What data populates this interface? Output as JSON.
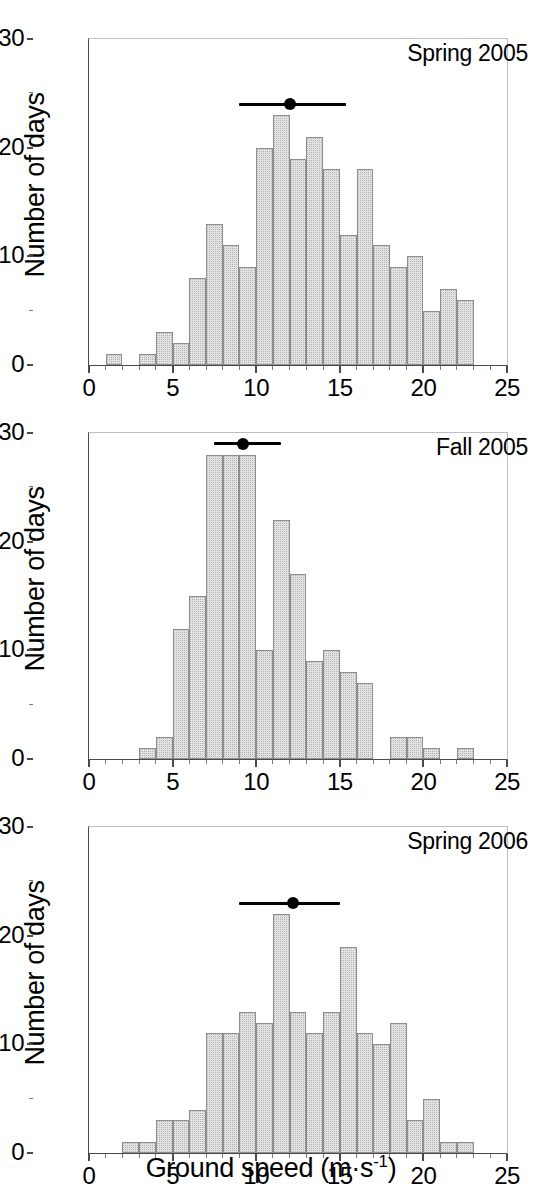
{
  "figure": {
    "xlabel_main": "Ground speed (m",
    "xlabel_mid": "·s",
    "xlabel_sup": "-1",
    "xlabel_end": ")",
    "xlabel_full": "Ground speed (m·s-1)",
    "ylabel": "Number of days",
    "bar_fill": "#e2e2e2",
    "bar_edge": "#8e8e8e",
    "marker_color": "#000000"
  },
  "axes": {
    "x_ticks_major": [
      "0",
      "5",
      "10",
      "15",
      "20",
      "25"
    ],
    "x_ticks_major_values": [
      0,
      5,
      10,
      15,
      20,
      25
    ],
    "x_minor_step": 1,
    "y_ticks_major": [
      "0",
      "10",
      "20",
      "30"
    ],
    "y_ticks_major_values": [
      0,
      10,
      20,
      30
    ],
    "y_minor_step": 5,
    "xlim": [
      0,
      25
    ],
    "ylim": [
      0,
      30
    ]
  },
  "chart_data": [
    {
      "type": "bar",
      "title": "Spring 2005",
      "xlabel": "Ground speed (m·s-1)",
      "ylabel": "Number of days",
      "xlim": [
        0,
        25
      ],
      "ylim": [
        0,
        30
      ],
      "grid": false,
      "bin_width": 1,
      "bin_starts": [
        1,
        3,
        4,
        5,
        6,
        7,
        8,
        9,
        10,
        11,
        12,
        13,
        14,
        15,
        16,
        17,
        18,
        19,
        20,
        21
      ],
      "categories": [
        "1-2",
        "3-4",
        "4-5",
        "5-6",
        "6-7",
        "7-8",
        "8-9",
        "9-10",
        "10-11",
        "11-12",
        "12-13",
        "13-14",
        "14-15",
        "15-16",
        "16-17",
        "17-18",
        "18-19",
        "19-20",
        "20-21",
        "21-22"
      ],
      "values": [
        1,
        1,
        3,
        2,
        8,
        13,
        11,
        9,
        20,
        23,
        19,
        21,
        18,
        12,
        18,
        11,
        9,
        10,
        5,
        7
      ],
      "extra_bar": {
        "bin_start": 22,
        "value": 6,
        "note": "22-23 bin"
      },
      "mean_marker": {
        "mean": 12.0,
        "low": 9.0,
        "high": 15.4,
        "y": 24
      }
    },
    {
      "type": "bar",
      "title": "Fall 2005",
      "xlabel": "Ground speed (m·s-1)",
      "ylabel": "Number of days",
      "xlim": [
        0,
        25
      ],
      "ylim": [
        0,
        30
      ],
      "grid": false,
      "bin_width": 1,
      "bin_starts": [
        3,
        4,
        5,
        6,
        7,
        8,
        9,
        10,
        11,
        12,
        13,
        14,
        15,
        16,
        18,
        19,
        22
      ],
      "categories": [
        "3-4",
        "4-5",
        "5-6",
        "6-7",
        "7-8",
        "8-9",
        "9-10",
        "10-11",
        "11-12",
        "12-13",
        "13-14",
        "14-15",
        "15-16",
        "16-17",
        "18-19",
        "19-20",
        "22-23"
      ],
      "values": [
        1,
        2,
        12,
        15,
        28,
        28,
        28,
        10,
        22,
        17,
        9,
        10,
        8,
        7,
        2,
        2,
        1
      ],
      "extra_bar": {
        "bin_start": 20,
        "value": 1,
        "note": "20-21 bin"
      },
      "mean_marker": {
        "mean": 9.2,
        "low": 7.5,
        "high": 11.5,
        "y": 29
      }
    },
    {
      "type": "bar",
      "title": "Spring 2006",
      "xlabel": "Ground speed (m·s-1)",
      "ylabel": "Number of days",
      "xlim": [
        0,
        25
      ],
      "ylim": [
        0,
        30
      ],
      "grid": false,
      "bin_width": 1,
      "bin_starts": [
        2,
        3,
        4,
        5,
        6,
        7,
        8,
        9,
        10,
        11,
        12,
        13,
        14,
        15,
        16,
        17,
        18,
        19,
        20,
        21
      ],
      "categories": [
        "2-3",
        "3-4",
        "4-5",
        "5-6",
        "6-7",
        "7-8",
        "8-9",
        "9-10",
        "10-11",
        "11-12",
        "12-13",
        "13-14",
        "14-15",
        "15-16",
        "16-17",
        "17-18",
        "18-19",
        "19-20",
        "20-21",
        "21-22"
      ],
      "values": [
        1,
        1,
        3,
        3,
        4,
        11,
        11,
        13,
        12,
        22,
        13,
        11,
        13,
        19,
        11,
        10,
        12,
        3,
        5,
        1
      ],
      "extra_bar": {
        "bin_start": 22,
        "value": 1,
        "note": "22-23 bin"
      },
      "mean_marker": {
        "mean": 12.2,
        "low": 9.0,
        "high": 15.0,
        "y": 23
      }
    }
  ]
}
